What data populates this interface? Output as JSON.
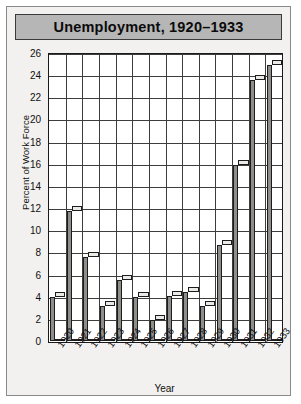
{
  "figure": {
    "title": "Unemployment, 1920–1933"
  },
  "chart_data": {
    "type": "bar",
    "title": "Unemployment, 1920–1933",
    "xlabel": "Year",
    "ylabel": "Percent of Work Force",
    "categories": [
      "1920",
      "1921",
      "1922",
      "1923",
      "1924",
      "1925",
      "1926",
      "1927",
      "1928",
      "1929",
      "1930",
      "1931",
      "1932",
      "1933"
    ],
    "values": [
      4.0,
      11.7,
      7.6,
      3.2,
      5.5,
      4.0,
      1.9,
      4.1,
      4.4,
      3.2,
      8.7,
      15.9,
      23.6,
      24.9
    ],
    "ylim": [
      0,
      26
    ],
    "yticks": [
      0,
      2,
      4,
      6,
      8,
      10,
      12,
      14,
      16,
      18,
      20,
      22,
      24,
      26
    ],
    "ytick_labels": [
      "0",
      "2",
      "4",
      "6",
      "8",
      "10",
      "12",
      "14",
      "16",
      "18",
      "20",
      "22",
      "24",
      "26"
    ],
    "grid": true,
    "legend": null,
    "style": "3d-bar",
    "colors": {
      "bar_front": "#d6d4d1",
      "bar_side": "#8f8d8a",
      "bar_top": "#eceae7",
      "plot_background": "#ffffff",
      "figure_background": "#f2f1ef",
      "title_background": "#b6b6b6",
      "grid_line": "#3d3d3d",
      "text": "#101010"
    }
  }
}
